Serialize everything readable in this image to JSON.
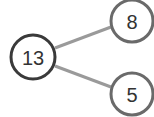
{
  "diagram": {
    "type": "number-bond",
    "whole": {
      "value": "13",
      "cx": 33,
      "cy": 57,
      "r": 22,
      "stroke": "#3a3a3a"
    },
    "parts": [
      {
        "value": "8",
        "cx": 132,
        "cy": 21,
        "r": 21,
        "stroke": "#6a6a6a"
      },
      {
        "value": "5",
        "cx": 132,
        "cy": 94,
        "r": 21,
        "stroke": "#6a6a6a"
      }
    ],
    "connector_color": "#9a9a9a"
  }
}
